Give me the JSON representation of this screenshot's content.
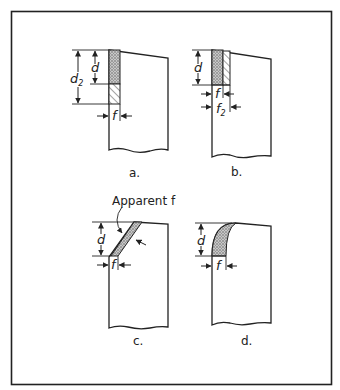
{
  "figure": {
    "type": "diagram",
    "colors": {
      "line": "#222222",
      "stipple": "#9a9a9a",
      "background": "#ffffff"
    },
    "panels": [
      {
        "id": "a",
        "caption": "a.",
        "dims": {
          "depth": "d",
          "depth2_base": "d",
          "depth2_sub": "2",
          "width": "f"
        }
      },
      {
        "id": "b",
        "caption": "b.",
        "dims": {
          "depth": "d",
          "width": "f",
          "width2_base": "f",
          "width2_sub": "2"
        }
      },
      {
        "id": "c",
        "caption": "c.",
        "annotation": "Apparent f",
        "dims": {
          "depth": "d",
          "width": "f"
        }
      },
      {
        "id": "d",
        "caption": "d.",
        "dims": {
          "depth": "d",
          "width": "f"
        }
      }
    ]
  }
}
